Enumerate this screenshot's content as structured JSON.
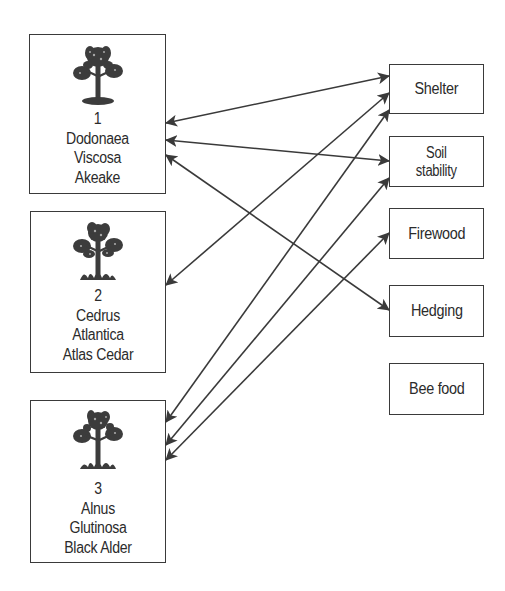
{
  "trees": [
    {
      "number": "1",
      "lines": [
        "Dodonaea",
        "Viscosa",
        "Akeake"
      ],
      "icon": "tree-icon",
      "box": {
        "x": 29,
        "y": 34,
        "w": 137,
        "h": 160
      },
      "icon_top": 8,
      "label_top": 70
    },
    {
      "number": "2",
      "lines": [
        "Cedrus",
        "Atlantica",
        "Atlas Cedar"
      ],
      "icon": "tree-icon",
      "box": {
        "x": 30,
        "y": 211,
        "w": 136,
        "h": 162
      },
      "icon_top": 8,
      "label_top": 70
    },
    {
      "number": "3",
      "lines": [
        "Alnus",
        "Glutinosa",
        "Black Alder"
      ],
      "icon": "tree-icon",
      "box": {
        "x": 30,
        "y": 400,
        "w": 136,
        "h": 163
      },
      "icon_top": 8,
      "label_top": 74
    }
  ],
  "uses": [
    {
      "label": "Shelter",
      "box": {
        "x": 389,
        "y": 64,
        "w": 95,
        "h": 50
      }
    },
    {
      "label": "Soil stability",
      "line1": "Soil",
      "line2": "stability",
      "box": {
        "x": 389,
        "y": 136,
        "w": 95,
        "h": 51
      }
    },
    {
      "label": "Firewood",
      "box": {
        "x": 389,
        "y": 208,
        "w": 95,
        "h": 51
      }
    },
    {
      "label": "Hedging",
      "box": {
        "x": 389,
        "y": 285,
        "w": 95,
        "h": 52
      }
    },
    {
      "label": "Bee food",
      "box": {
        "x": 389,
        "y": 363,
        "w": 95,
        "h": 52
      }
    }
  ],
  "connections": [
    {
      "from": "1",
      "to": "Shelter",
      "x1": 166,
      "y1": 123,
      "x2": 389,
      "y2": 76
    },
    {
      "from": "1",
      "to": "Soil stability",
      "x1": 166,
      "y1": 140,
      "x2": 389,
      "y2": 161
    },
    {
      "from": "1",
      "to": "Hedging",
      "x1": 166,
      "y1": 155,
      "x2": 389,
      "y2": 310
    },
    {
      "from": "2",
      "to": "Shelter",
      "x1": 166,
      "y1": 285,
      "x2": 389,
      "y2": 93
    },
    {
      "from": "3",
      "to": "Shelter",
      "x1": 166,
      "y1": 422,
      "x2": 389,
      "y2": 110
    },
    {
      "from": "3",
      "to": "Soil stability",
      "x1": 166,
      "y1": 445,
      "x2": 389,
      "y2": 178
    },
    {
      "from": "3",
      "to": "Firewood",
      "x1": 166,
      "y1": 460,
      "x2": 389,
      "y2": 233
    }
  ],
  "colors": {
    "line": "#3a3a3a",
    "text": "#2b2b2b",
    "tree": "#3c3c3c"
  }
}
